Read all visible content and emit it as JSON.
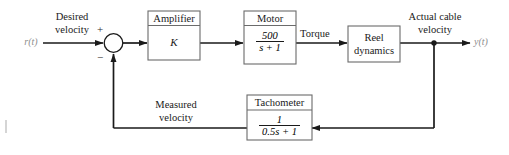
{
  "diagram": {
    "line_color": "#1a1a1a",
    "block_border_color": "#6b6b6b",
    "label_color": "#1a1a1a",
    "io_label_color": "#8d8d8d",
    "input": {
      "label_line1": "Desired",
      "label_line2": "velocity",
      "variable": "r(t)"
    },
    "output": {
      "label_line1": "Actual cable",
      "label_line2": "velocity",
      "variable": "y(t)"
    },
    "summing_junction": {
      "name": "summing-junction",
      "plus_sign": "+",
      "minus_sign": "−"
    },
    "blocks": [
      {
        "id": "amplifier",
        "title": "Amplifier",
        "body_text": "K",
        "has_title_bar": true,
        "body_type": "text"
      },
      {
        "id": "motor",
        "title": "Motor",
        "numerator": "500",
        "denominator": "s + 1",
        "has_title_bar": true,
        "body_type": "fraction"
      },
      {
        "id": "reel-dynamics",
        "title": "",
        "body_line1": "Reel",
        "body_line2": "dynamics",
        "has_title_bar": false,
        "body_type": "two-line"
      },
      {
        "id": "tachometer",
        "title": "Tachometer",
        "numerator": "1",
        "denominator": "0.5s + 1",
        "has_title_bar": true,
        "body_type": "fraction"
      }
    ],
    "signals": [
      {
        "id": "torque",
        "label": "Torque"
      },
      {
        "id": "measured-velocity",
        "label_line1": "Measured",
        "label_line2": "velocity"
      }
    ]
  }
}
